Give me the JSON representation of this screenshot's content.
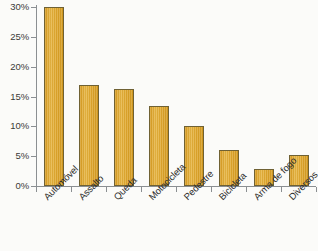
{
  "chart_data": {
    "type": "bar",
    "title": "",
    "subtitle": "",
    "xlabel": "",
    "ylabel": "",
    "categories": [
      "Automóvel",
      "Assalto",
      "Queda",
      "Motocicleta",
      "Pedestre",
      "Bicicleta",
      "Arma de fogo",
      "Diversos"
    ],
    "values": [
      30.0,
      16.9,
      16.2,
      13.4,
      10.0,
      6.1,
      2.9,
      5.2
    ],
    "ylim": [
      0,
      30
    ],
    "ytick_values": [
      0,
      5,
      10,
      15,
      20,
      25,
      30
    ],
    "ytick_labels": [
      "0%",
      "5%",
      "10%",
      "15%",
      "20%",
      "25%",
      "30%"
    ],
    "grid": false,
    "legend": null,
    "legend_position": "none",
    "bar_color": "#e0a82e",
    "bar_edge_color": "#6f6134",
    "axis_color": "#8b8f92",
    "text_color": "#2e2e2c",
    "background_color": "#fbfbf9",
    "xtick_label_rotation": -45,
    "annotations": []
  },
  "caption_strip": ""
}
